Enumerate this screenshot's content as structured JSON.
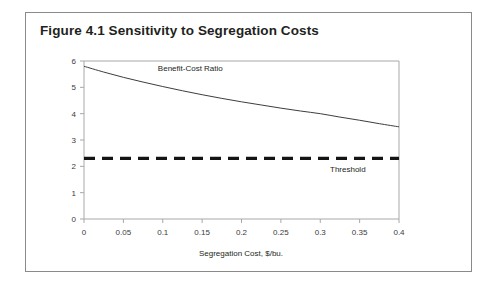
{
  "figure": {
    "title": "Figure 4.1 Sensitivity to Segregation Costs"
  },
  "chart_data": {
    "type": "line",
    "title": "Figure 4.1 Sensitivity to Segregation Costs",
    "xlabel": "Segregation Cost, $/bu.",
    "ylabel": "",
    "xlim": [
      0,
      0.4
    ],
    "ylim": [
      0,
      6
    ],
    "grid": false,
    "legend_position": "inline-annotations",
    "xticks": [
      0,
      0.05,
      0.1,
      0.15,
      0.2,
      0.25,
      0.3,
      0.35,
      0.4
    ],
    "xtick_labels": [
      "0",
      "0.05",
      "0.1",
      "0.15",
      "0.2",
      "0.25",
      "0.3",
      "0.35",
      "0.4"
    ],
    "yticks": [
      0,
      1,
      2,
      3,
      4,
      5,
      6
    ],
    "ytick_labels": [
      "0",
      "1",
      "2",
      "3",
      "4",
      "5",
      "6"
    ],
    "series": [
      {
        "name": "Benefit-Cost Ratio",
        "style": "solid",
        "color": "#3d3d3d",
        "x": [
          0,
          0.025,
          0.05,
          0.075,
          0.1,
          0.125,
          0.15,
          0.175,
          0.2,
          0.225,
          0.25,
          0.275,
          0.3,
          0.325,
          0.35,
          0.375,
          0.4
        ],
        "values": [
          5.8,
          5.58,
          5.38,
          5.2,
          5.03,
          4.87,
          4.72,
          4.58,
          4.45,
          4.33,
          4.21,
          4.1,
          4.0,
          3.87,
          3.75,
          3.62,
          3.5
        ]
      },
      {
        "name": "Threshold",
        "style": "dashed",
        "color": "#141414",
        "x": [
          0,
          0.4
        ],
        "values": [
          2.3,
          2.3
        ]
      }
    ],
    "annotations": [
      {
        "text": "Benefit-Cost Ratio",
        "x": 0.135,
        "y": 5.62
      },
      {
        "text": "Threshold",
        "x": 0.335,
        "y": 1.78
      }
    ]
  },
  "axis_labels": {
    "x_title": "Segregation Cost, $/bu."
  },
  "colors": {
    "frame": "#8a8a8a",
    "axis": "#a8a8a8",
    "curve": "#3d3d3d",
    "threshold": "#141414",
    "title_text": "#231f20",
    "background": "#ffffff"
  }
}
